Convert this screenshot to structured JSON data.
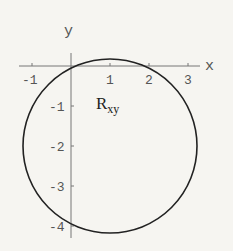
{
  "diagram": {
    "axes": {
      "x_label": "x",
      "y_label": "y",
      "x_ticks": [
        "-1",
        "1",
        "2",
        "3"
      ],
      "y_ticks": [
        "-1",
        "-2",
        "-3",
        "-4"
      ]
    },
    "region": {
      "label_main": "R",
      "label_sub": "xy"
    },
    "circle": {
      "center": [
        1,
        -2
      ],
      "radius": 2.236
    },
    "colors": {
      "background": "#f6f5f1",
      "axis": "#777777",
      "curve": "#222222"
    }
  }
}
